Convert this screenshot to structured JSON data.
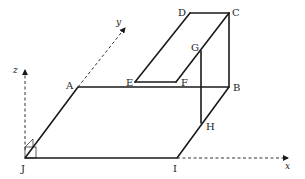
{
  "diagram": {
    "type": "3d-geometry-figure",
    "colors": {
      "line": "#1a1a1a",
      "text": "#222222",
      "background": "#ffffff"
    },
    "points": {
      "A": {
        "label": "A"
      },
      "B": {
        "label": "B"
      },
      "C": {
        "label": "C"
      },
      "D": {
        "label": "D"
      },
      "E": {
        "label": "E"
      },
      "F": {
        "label": "F"
      },
      "G": {
        "label": "G"
      },
      "H": {
        "label": "H"
      },
      "I": {
        "label": "I"
      },
      "J": {
        "label": "J"
      }
    },
    "axes": {
      "x": {
        "label": "x"
      },
      "y": {
        "label": "y"
      },
      "z": {
        "label": "z"
      }
    },
    "segments": [
      "JA",
      "AB",
      "BI",
      "IJ",
      "BC",
      "CD",
      "DE",
      "EF",
      "FC",
      "GH"
    ],
    "dashed_axes": [
      "J-x (from I)",
      "J-y",
      "J-z"
    ]
  }
}
